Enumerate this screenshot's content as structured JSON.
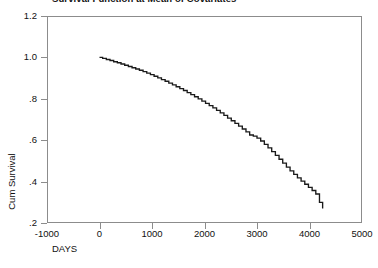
{
  "chart_data": {
    "type": "line",
    "title": "Survival Function at Mean of Covariates",
    "xlabel": "DAYS",
    "ylabel": "Cum Survival",
    "xlim": [
      -1000,
      5000
    ],
    "ylim": [
      0.2,
      1.2
    ],
    "xticks": [
      -1000,
      0,
      1000,
      2000,
      3000,
      4000,
      5000
    ],
    "xtick_labels": [
      "-1000",
      "0",
      "1000",
      "2000",
      "3000",
      "4000",
      "5000"
    ],
    "yticks": [
      0.2,
      0.4,
      0.6,
      0.8,
      1.0,
      1.2
    ],
    "ytick_labels": [
      ".2",
      ".4",
      ".6",
      ".8",
      "1.0",
      "1.2"
    ],
    "grid": false,
    "legend": "none",
    "step_style": "post",
    "line_color": "#1a1a1a",
    "frame_color": "#8c8c8c",
    "series": [
      {
        "name": "Survival function at mean of covariates",
        "x": [
          0,
          60,
          130,
          200,
          270,
          340,
          410,
          480,
          550,
          620,
          690,
          760,
          830,
          900,
          970,
          1040,
          1110,
          1180,
          1250,
          1320,
          1390,
          1460,
          1530,
          1600,
          1670,
          1740,
          1810,
          1880,
          1950,
          2020,
          2090,
          2160,
          2230,
          2300,
          2370,
          2440,
          2510,
          2580,
          2650,
          2720,
          2790,
          2860,
          2930,
          3000,
          3070,
          3140,
          3210,
          3280,
          3350,
          3420,
          3490,
          3560,
          3630,
          3700,
          3770,
          3840,
          3910,
          3980,
          4050,
          4120,
          4190,
          4250
        ],
        "y": [
          1.0,
          0.995,
          0.99,
          0.985,
          0.979,
          0.974,
          0.968,
          0.962,
          0.956,
          0.95,
          0.944,
          0.938,
          0.931,
          0.924,
          0.917,
          0.909,
          0.901,
          0.893,
          0.885,
          0.876,
          0.867,
          0.858,
          0.849,
          0.84,
          0.83,
          0.82,
          0.81,
          0.8,
          0.789,
          0.778,
          0.767,
          0.756,
          0.744,
          0.732,
          0.72,
          0.707,
          0.694,
          0.681,
          0.668,
          0.654,
          0.64,
          0.625,
          0.62,
          0.61,
          0.596,
          0.58,
          0.563,
          0.545,
          0.527,
          0.508,
          0.489,
          0.47,
          0.452,
          0.435,
          0.418,
          0.402,
          0.387,
          0.372,
          0.357,
          0.34,
          0.3,
          0.27
        ]
      }
    ]
  }
}
